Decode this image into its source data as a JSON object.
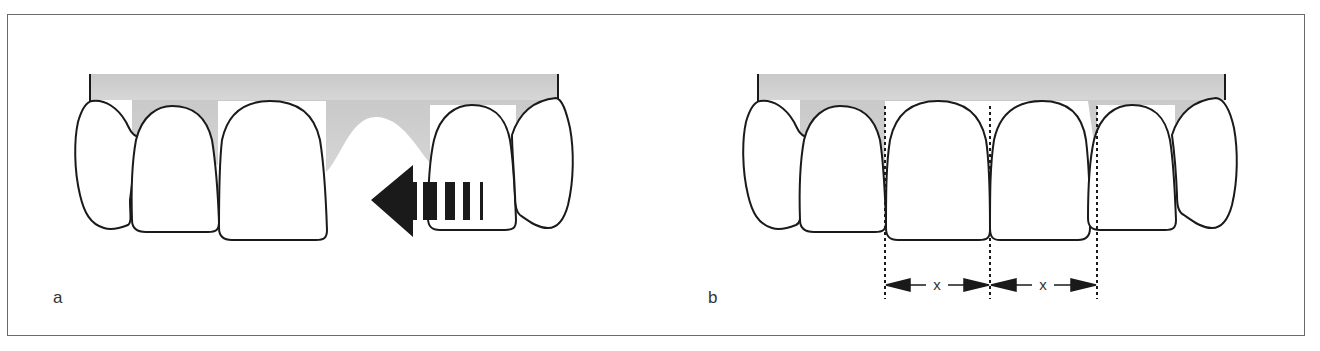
{
  "figure": {
    "panels": [
      {
        "id": "a",
        "label": "a",
        "description": "Upper anterior teeth with missing tooth space; arrow indicates mesial movement of lateral incisor"
      },
      {
        "id": "b",
        "label": "b",
        "description": "Upper anterior teeth with two equal-width central incisors",
        "dimensions": [
          {
            "label": "x"
          },
          {
            "label": "x"
          }
        ]
      }
    ],
    "colors": {
      "gum": "#cfcfcf",
      "tooth": "#ffffff",
      "outline": "#1a1a1a",
      "arrow": "#1a1a1a",
      "frame": "#6a6a6a"
    }
  }
}
